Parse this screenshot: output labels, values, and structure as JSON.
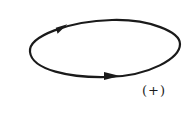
{
  "diagram": {
    "type": "oriented closed loop",
    "shape": "ellipse",
    "orientation": "clockwise-style arrows: top arrow pointing right, bottom arrow pointing right",
    "stroke_color": "#1a1a1a",
    "arrows": [
      {
        "position": "top-left",
        "direction": "right"
      },
      {
        "position": "bottom-center",
        "direction": "right"
      }
    ],
    "label": "(+)"
  }
}
